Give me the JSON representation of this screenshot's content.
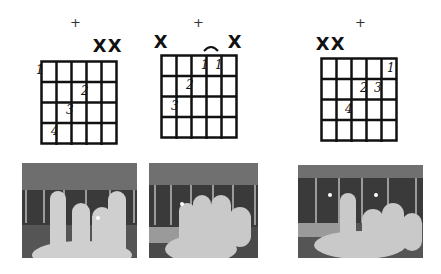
{
  "diagrams": [
    {
      "id": "chord-1",
      "top_symbol": "+",
      "string_marks": [
        "",
        "",
        "",
        "",
        "X",
        "X"
      ],
      "fingers": [
        {
          "label": "1",
          "string": 1,
          "fret": 1
        },
        {
          "label": "2",
          "string": 4,
          "fret": 2
        },
        {
          "label": "3",
          "string": 3,
          "fret": 3
        },
        {
          "label": "4",
          "string": 2,
          "fret": 4
        }
      ],
      "frets_shown": 4,
      "strings": 6
    },
    {
      "id": "chord-2",
      "top_symbol": "+",
      "string_marks": [
        "X",
        "",
        "",
        "",
        "",
        "X"
      ],
      "barre": {
        "from_string": 4,
        "to_string": 5,
        "fret": 1,
        "symbol": "⌒"
      },
      "fingers": [
        {
          "label": "1",
          "string": 4,
          "fret": 1
        },
        {
          "label": "1",
          "string": 5,
          "fret": 1
        },
        {
          "label": "2",
          "string": 3,
          "fret": 2
        },
        {
          "label": "3",
          "string": 2,
          "fret": 3
        }
      ],
      "frets_shown": 4,
      "strings": 6
    },
    {
      "id": "chord-3",
      "top_symbol": "+",
      "string_marks": [
        "X",
        "X",
        "",
        "",
        "",
        ""
      ],
      "fingers": [
        {
          "label": "1",
          "string": 6,
          "fret": 1
        },
        {
          "label": "2",
          "string": 4,
          "fret": 2
        },
        {
          "label": "3",
          "string": 5,
          "fret": 2
        },
        {
          "label": "4",
          "string": 3,
          "fret": 3
        }
      ],
      "frets_shown": 4,
      "strings": 6
    }
  ],
  "photos": [
    {
      "id": "photo-1",
      "description": "hand fretting chord 1 on guitar neck"
    },
    {
      "id": "photo-2",
      "description": "hand fretting chord 2 on guitar neck"
    },
    {
      "id": "photo-3",
      "description": "hand fretting chord 3 on guitar neck"
    }
  ],
  "colors": {
    "grid": "#111111",
    "background": "#ffffff",
    "photo_dark": "#3c3c3c",
    "photo_skin": "#c8c8c8"
  }
}
